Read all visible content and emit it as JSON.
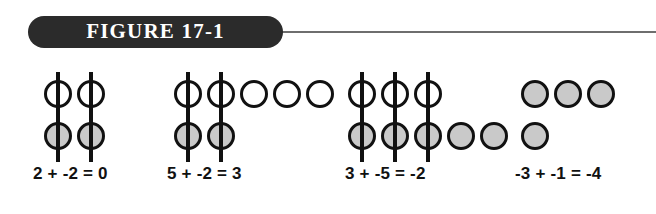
{
  "figure": {
    "label": "FIGURE 17-1",
    "rule_color": "#6e6e6e",
    "pill_color": "#2b2b2b",
    "label_color": "#ffffff"
  },
  "colors": {
    "positive_counter": "#ffffff",
    "negative_counter": "#c9c9c9",
    "outline": "#111111",
    "text": "#111111"
  },
  "legend": {
    "positive_name": "white-circle-counter",
    "negative_name": "gray-circle-counter",
    "cancel_name": "strikethrough-line"
  },
  "groups": [
    {
      "id": "group-1",
      "left": 44,
      "equation": "2 + -2 = 0",
      "equation_left": 33,
      "addend_positive": 2,
      "addend_negative": -2,
      "sum": 0,
      "top_row": {
        "count": 2,
        "type": "positive",
        "crossed": [
          true,
          true
        ]
      },
      "bottom_row": {
        "count": 2,
        "type": "negative",
        "crossed": [
          true,
          true
        ]
      }
    },
    {
      "id": "group-2",
      "left": 174,
      "equation": "5 + -2 = 3",
      "equation_left": 167,
      "addend_positive": 5,
      "addend_negative": -2,
      "sum": 3,
      "top_row": {
        "count": 5,
        "type": "positive",
        "crossed": [
          true,
          true,
          false,
          false,
          false
        ]
      },
      "bottom_row": {
        "count": 2,
        "type": "negative",
        "crossed": [
          true,
          true
        ]
      }
    },
    {
      "id": "group-3",
      "left": 348,
      "equation": "3 + -5 = -2",
      "equation_left": 345,
      "addend_positive": 3,
      "addend_negative": -5,
      "sum": -2,
      "top_row": {
        "count": 3,
        "type": "positive",
        "crossed": [
          true,
          true,
          true
        ]
      },
      "bottom_row": {
        "count": 5,
        "type": "negative",
        "crossed": [
          true,
          true,
          true,
          false,
          false
        ]
      }
    },
    {
      "id": "group-4",
      "left": 521,
      "equation": "-3 + -1 = -4",
      "equation_left": 515,
      "addend_positive": -3,
      "addend_negative": -1,
      "sum": -4,
      "top_row": {
        "count": 3,
        "type": "negative",
        "crossed": [
          false,
          false,
          false
        ]
      },
      "bottom_row": {
        "count": 1,
        "type": "negative",
        "crossed": [
          false
        ]
      }
    }
  ]
}
